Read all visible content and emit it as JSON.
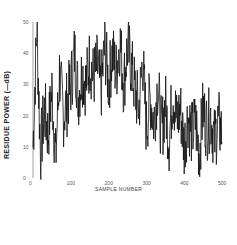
{
  "chart_data": {
    "type": "line",
    "title": "",
    "xlabel": "SAMPLE NUMBER",
    "ylabel": "RESIDUE POWER (—dB)",
    "xlim": [
      0,
      500
    ],
    "ylim": [
      0,
      50
    ],
    "xticks": [
      "0",
      "100",
      "200",
      "300",
      "400",
      "500"
    ],
    "yticks": [
      "50",
      "40",
      "30",
      "20",
      "10",
      "0"
    ],
    "grid": false,
    "legend": null,
    "series": [
      {
        "name": "residue power",
        "x": [
          0,
          10,
          20,
          30,
          40,
          50,
          60,
          70,
          80,
          90,
          100,
          110,
          120,
          130,
          140,
          150,
          160,
          170,
          180,
          190,
          200,
          210,
          220,
          230,
          240,
          250,
          260,
          270,
          280,
          290,
          300,
          310,
          320,
          330,
          340,
          350,
          360,
          370,
          380,
          390,
          400,
          410,
          420,
          430,
          440,
          450,
          460,
          470,
          480,
          490,
          500
        ],
        "values": [
          10,
          48,
          8,
          22,
          14,
          28,
          6,
          34,
          20,
          24,
          30,
          40,
          26,
          34,
          30,
          38,
          32,
          36,
          28,
          42,
          30,
          40,
          34,
          44,
          30,
          42,
          36,
          28,
          22,
          38,
          16,
          26,
          18,
          30,
          14,
          24,
          12,
          28,
          18,
          22,
          10,
          20,
          14,
          18,
          8,
          22,
          16,
          20,
          12,
          18,
          14
        ]
      }
    ]
  }
}
